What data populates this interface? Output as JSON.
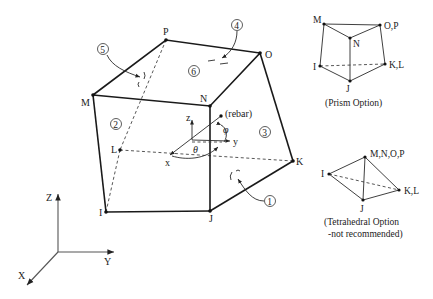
{
  "figure": {
    "main_element": {
      "nodes": {
        "P": "P",
        "O": "O",
        "M": "M",
        "N": "N",
        "L": "L",
        "I": "I",
        "J": "J",
        "K": "K"
      },
      "faces": [
        "1",
        "2",
        "3",
        "4",
        "5",
        "6"
      ],
      "local_axes": {
        "x": "x",
        "y": "y",
        "z": "z"
      },
      "angles": {
        "theta": "θ",
        "phi": "φ"
      },
      "rebar_label": "(rebar)"
    },
    "global_axes": {
      "X": "X",
      "Y": "Y",
      "Z": "Z"
    },
    "prism_option": {
      "nodes": {
        "M": "M",
        "N": "N",
        "OP": "O,P",
        "I": "I",
        "J": "J",
        "KL": "K,L"
      },
      "caption": "(Prism Option)"
    },
    "tetra_option": {
      "nodes": {
        "MNOP": "M,N,O,P",
        "I": "I",
        "J": "J",
        "KL": "K,L"
      },
      "caption_line1": "(Tetrahedral Option",
      "caption_line2": "-not recommended)"
    }
  }
}
